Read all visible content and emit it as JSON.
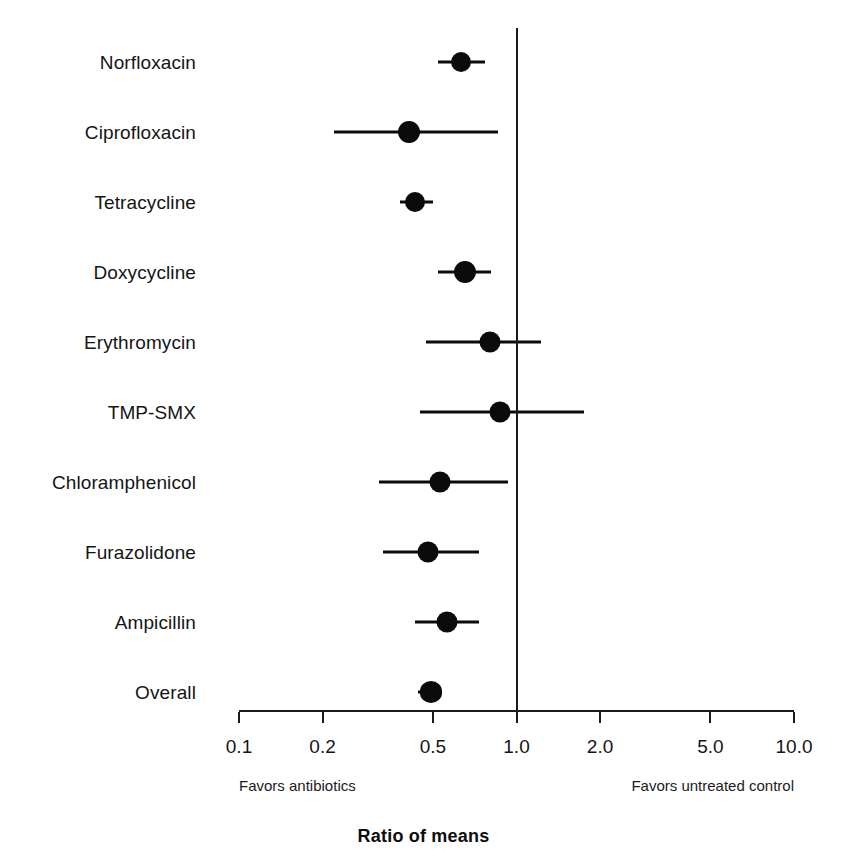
{
  "chart_data": {
    "type": "scatter",
    "subtype": "forest-plot",
    "title": "",
    "xlabel": "Ratio of means",
    "ylabel": "",
    "scale": "log10",
    "xlim": [
      0.1,
      10.0
    ],
    "grid": false,
    "legend": null,
    "null_value": 1.0,
    "xticks": [
      0.1,
      0.2,
      0.5,
      1.0,
      2.0,
      5.0,
      10.0
    ],
    "xtick_labels": [
      "0.1",
      "0.2",
      "0.5",
      "1.0",
      "2.0",
      "5.0",
      "10.0"
    ],
    "annotations": {
      "left": "Favors antibiotics",
      "right": "Favors untreated control"
    },
    "categories": [
      "Norfloxacin",
      "Ciprofloxacin",
      "Tetracycline",
      "Doxycycline",
      "Erythromycin",
      "TMP-SMX",
      "Chloramphenicol",
      "Furazolidone",
      "Ampicillin",
      "Overall"
    ],
    "rows": [
      {
        "label": "Norfloxacin",
        "estimate": 0.63,
        "ci_low": 0.52,
        "ci_high": 0.77,
        "marker": "circle",
        "marker_size": 20
      },
      {
        "label": "Ciprofloxacin",
        "estimate": 0.41,
        "ci_low": 0.22,
        "ci_high": 0.86,
        "marker": "circle",
        "marker_size": 22
      },
      {
        "label": "Tetracycline",
        "estimate": 0.43,
        "ci_low": 0.38,
        "ci_high": 0.5,
        "marker": "circle",
        "marker_size": 20
      },
      {
        "label": "Doxycycline",
        "estimate": 0.65,
        "ci_low": 0.52,
        "ci_high": 0.81,
        "marker": "circle",
        "marker_size": 22
      },
      {
        "label": "Erythromycin",
        "estimate": 0.8,
        "ci_low": 0.47,
        "ci_high": 1.23,
        "marker": "circle",
        "marker_size": 21
      },
      {
        "label": "TMP-SMX",
        "estimate": 0.87,
        "ci_low": 0.45,
        "ci_high": 1.75,
        "marker": "circle",
        "marker_size": 21
      },
      {
        "label": "Chloramphenicol",
        "estimate": 0.53,
        "ci_low": 0.32,
        "ci_high": 0.93,
        "marker": "circle",
        "marker_size": 21
      },
      {
        "label": "Furazolidone",
        "estimate": 0.48,
        "ci_low": 0.33,
        "ci_high": 0.73,
        "marker": "circle",
        "marker_size": 21
      },
      {
        "label": "Ampicillin",
        "estimate": 0.56,
        "ci_low": 0.43,
        "ci_high": 0.73,
        "marker": "circle",
        "marker_size": 21
      },
      {
        "label": "Overall",
        "estimate": 0.49,
        "ci_low": 0.44,
        "ci_high": 0.53,
        "marker": "diamond",
        "marker_size": 22
      }
    ]
  },
  "colors": {
    "marker": "#0b0b0b",
    "line": "#0b0b0b",
    "axis": "#1a1a1a",
    "text": "#151515",
    "background": "#ffffff"
  },
  "axis": {
    "title": "Ratio of means"
  },
  "footnotes": {
    "favors_left": "Favors antibiotics",
    "favors_right": "Favors untreated control"
  }
}
